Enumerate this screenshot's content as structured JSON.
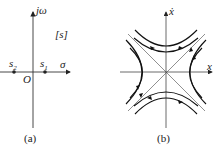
{
  "panel_a": {
    "caption": "(a)",
    "axis_y_label": "jω",
    "axis_x_label": "σ",
    "plane_label": "[s]",
    "origin_label": "O",
    "points": [
      {
        "label": "s",
        "sub": "2",
        "x": 14,
        "y": 72
      },
      {
        "label": "s",
        "sub": "1",
        "x": 45,
        "y": 72
      }
    ]
  },
  "panel_b": {
    "caption": "(b)",
    "axis_y_label": "ẋ",
    "axis_x_label": "x"
  }
}
